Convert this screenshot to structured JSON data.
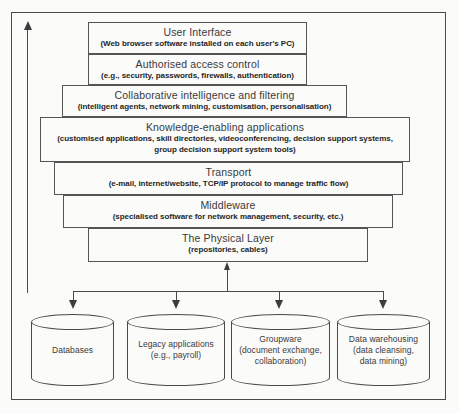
{
  "diagram": {
    "frame_color": "#4a4a4a",
    "background_color": "#fbfbfa"
  },
  "layers": [
    {
      "id": "user-interface",
      "title": "User Interface",
      "subtitle": "(Web browser software installed on each user's PC)",
      "subtitle2": ""
    },
    {
      "id": "authorised-access-control",
      "title": "Authorised access control",
      "subtitle": "(e.g., security, passwords, firewalls, authentication)",
      "subtitle2": ""
    },
    {
      "id": "collaborative-intelligence-and-filtering",
      "title": "Collaborative intelligence and filtering",
      "subtitle": "(intelligent agents, network mining, customisation, personalisation)",
      "subtitle2": ""
    },
    {
      "id": "knowledge-enabling-applications",
      "title": "Knowledge-enabling applications",
      "subtitle": "(customised applications, skill directories,  videoconferencing, decision support systems,",
      "subtitle2": "group decision support system tools)"
    },
    {
      "id": "transport",
      "title": "Transport",
      "subtitle": "(e-mail, internet/website, TCP/IP protocol to manage traffic flow)",
      "subtitle2": ""
    },
    {
      "id": "middleware",
      "title": "Middleware",
      "subtitle": "(specialised software for network  management, security, etc.)",
      "subtitle2": ""
    },
    {
      "id": "the-physical-layer",
      "title": "The Physical Layer",
      "subtitle": "(repositories, cables)",
      "subtitle2": ""
    }
  ],
  "repositories": [
    {
      "id": "databases",
      "line1": "Databases",
      "line2": "",
      "line3": ""
    },
    {
      "id": "legacy-applications",
      "line1": "Legacy applications",
      "line2": "(e.g., payroll)",
      "line3": ""
    },
    {
      "id": "groupware",
      "line1": "Groupware",
      "line2": "(document exchange,",
      "line3": "collaboration)"
    },
    {
      "id": "data-warehousing",
      "line1": "Data warehousing",
      "line2": "(data cleansing,",
      "line3": "data mining)"
    }
  ]
}
